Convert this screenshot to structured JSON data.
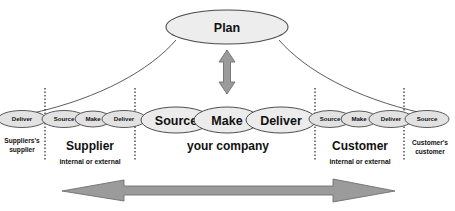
{
  "diagram": {
    "plan": {
      "label": "Plan"
    },
    "colors": {
      "ellipse_fill": "#ececec",
      "ellipse_stroke": "#3a3a3a",
      "arrow_fill": "#9b9b9b",
      "arrow_stroke": "#6f6f6f",
      "divider": "#111111",
      "background": "#ffffff"
    },
    "sections": [
      {
        "id": "suppliers-supplier",
        "title_line1": "Suppliers's",
        "title_line2": "supplier",
        "subtitle": "",
        "processes": [
          {
            "label": "Deliver",
            "size": "small"
          }
        ]
      },
      {
        "id": "supplier",
        "title_line1": "Supplier",
        "title_line2": "",
        "subtitle": "internal or external",
        "processes": [
          {
            "label": "Source",
            "size": "small"
          },
          {
            "label": "Make",
            "size": "small"
          },
          {
            "label": "Deliver",
            "size": "small"
          }
        ]
      },
      {
        "id": "your-company",
        "title_line1": "your company",
        "title_line2": "",
        "subtitle": "",
        "processes": [
          {
            "label": "Source",
            "size": "large"
          },
          {
            "label": "Make",
            "size": "large"
          },
          {
            "label": "Deliver",
            "size": "large"
          }
        ]
      },
      {
        "id": "customer",
        "title_line1": "Customer",
        "title_line2": "",
        "subtitle": "internal or external",
        "processes": [
          {
            "label": "Source",
            "size": "small"
          },
          {
            "label": "Make",
            "size": "small"
          },
          {
            "label": "Deliver",
            "size": "small"
          }
        ]
      },
      {
        "id": "customers-customer",
        "title_line1": "Customer's",
        "title_line2": "customer",
        "subtitle": "",
        "processes": [
          {
            "label": "Source",
            "size": "small"
          }
        ]
      }
    ],
    "arrows": {
      "vertical": {
        "name": "plan-link-arrow",
        "direction": "both"
      },
      "horizontal": {
        "name": "supply-chain-flow-arrow",
        "direction": "both"
      }
    },
    "process_labels": {
      "left_deliver": "Deliver",
      "sup_source": "Source",
      "sup_make": "Make",
      "sup_deliver": "Deliver",
      "co_source": "Source",
      "co_make": "Make",
      "co_deliver": "Deliver",
      "cust_source": "Source",
      "cust_make": "Make",
      "cust_deliver": "Deliver",
      "right_source": "Source"
    },
    "section_labels": {
      "suppliers_supplier_l1": "Suppliers's",
      "suppliers_supplier_l2": "supplier",
      "supplier": "Supplier",
      "supplier_sub": "internal or external",
      "your_company": "your company",
      "customer": "Customer",
      "customer_sub": "internal or external",
      "customers_customer_l1": "Customer's",
      "customers_customer_l2": "customer"
    }
  }
}
